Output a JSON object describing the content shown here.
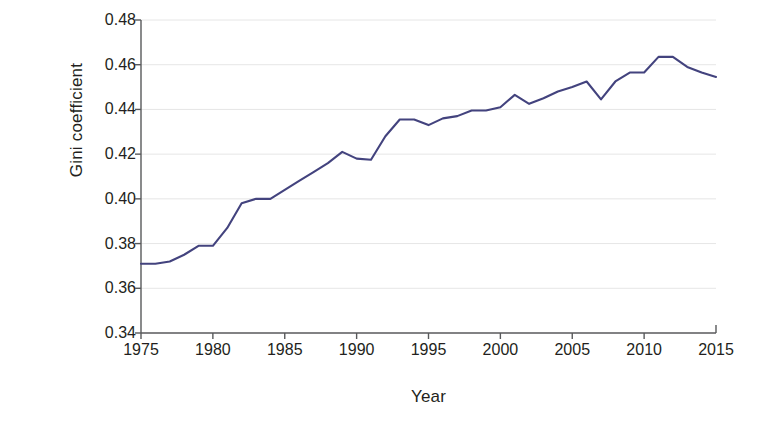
{
  "chart_data": {
    "type": "line",
    "title": "",
    "xlabel": "Year",
    "ylabel": "Gini coefficient",
    "xlim": [
      1975,
      2015
    ],
    "ylim": [
      0.34,
      0.48
    ],
    "xticks": [
      1975,
      1980,
      1985,
      1990,
      1995,
      2000,
      2005,
      2010,
      2015
    ],
    "xtick_labels": [
      "1975",
      "1980",
      "1985",
      "1990",
      "1995",
      "2000",
      "2005",
      "2010",
      "2015"
    ],
    "yticks": [
      0.34,
      0.36,
      0.38,
      0.4,
      0.42,
      0.44,
      0.46,
      0.48
    ],
    "ytick_labels": [
      "0.34",
      "0.36",
      "0.38",
      "0.40",
      "0.42",
      "0.44",
      "0.46",
      "0.48"
    ],
    "grid": "horizontal",
    "legend": "none",
    "line_color": "#43437e",
    "grid_color": "#e6e6e6",
    "axis_color": "#58595b",
    "background": "#ffffff",
    "series": [
      {
        "name": "Gini coefficient",
        "x": [
          1975,
          1976,
          1977,
          1978,
          1979,
          1980,
          1981,
          1982,
          1983,
          1984,
          1985,
          1986,
          1987,
          1988,
          1989,
          1990,
          1991,
          1992,
          1993,
          1994,
          1995,
          1996,
          1997,
          1998,
          1999,
          2000,
          2001,
          2002,
          2003,
          2004,
          2005,
          2006,
          2007,
          2008,
          2009,
          2010,
          2011,
          2012,
          2013,
          2014,
          2015
        ],
        "values": [
          0.371,
          0.371,
          0.372,
          0.375,
          0.379,
          0.379,
          0.387,
          0.398,
          0.4,
          0.4,
          0.404,
          0.408,
          0.412,
          0.416,
          0.421,
          0.418,
          0.4175,
          0.428,
          0.4355,
          0.4355,
          0.433,
          0.436,
          0.437,
          0.4395,
          0.4395,
          0.441,
          0.4465,
          0.4425,
          0.445,
          0.448,
          0.45,
          0.4525,
          0.4445,
          0.4525,
          0.4565,
          0.4565,
          0.4635,
          0.4635,
          0.459,
          0.4565,
          0.4545
        ]
      }
    ]
  }
}
